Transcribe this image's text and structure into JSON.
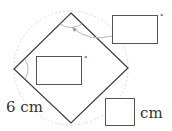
{
  "figure": {
    "type": "square-inscribed-in-circle",
    "square_vertices": {
      "top": [
        71,
        13
      ],
      "right": [
        128,
        68
      ],
      "bottom": [
        71,
        123
      ],
      "left": [
        14,
        69
      ]
    },
    "circle": {
      "cx": 71,
      "cy": 68,
      "r": 57,
      "style": "dashed"
    },
    "colors": {
      "line": "#3a3a3a",
      "circle": "#d0d0d0",
      "arc": "#b8b8b8",
      "box_border": "#555555"
    }
  },
  "side_label": "6 cm",
  "answer_boxes": [
    {
      "id": "top-angle",
      "unit": "°"
    },
    {
      "id": "left-angle",
      "unit": "°"
    },
    {
      "id": "length",
      "unit": "cm"
    }
  ]
}
